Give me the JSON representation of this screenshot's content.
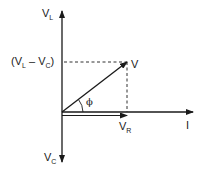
{
  "diagram": {
    "type": "phasor-diagram",
    "axes": {
      "vertical_up_label": {
        "main": "V",
        "sub": "L"
      },
      "vertical_down_label": {
        "main": "V",
        "sub": "C"
      },
      "horizontal_label": "I"
    },
    "vectors": {
      "resultant": {
        "label": "V"
      },
      "resistive": {
        "label": {
          "main": "V",
          "sub": "R"
        }
      }
    },
    "projection_label": {
      "open": "(V",
      "sub1": "L",
      "mid": " – V",
      "sub2": "C",
      "close": ")"
    },
    "angle_label": "ϕ",
    "colors": {
      "line": "#1a1a1a",
      "background": "#ffffff"
    }
  }
}
